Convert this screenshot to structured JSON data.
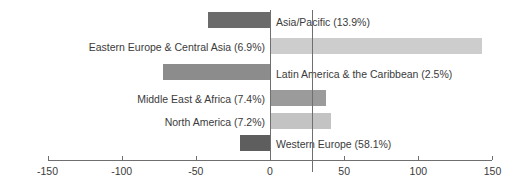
{
  "chart_data": {
    "type": "bar",
    "orientation": "horizontal",
    "title": "",
    "xlabel": "",
    "ylabel": "",
    "xlim": [
      -150,
      150
    ],
    "xticks": [
      -150,
      -100,
      -50,
      0,
      50,
      100,
      150
    ],
    "xtick_labels": [
      "-150",
      "-100",
      "-50",
      "0",
      "50",
      "100",
      "150"
    ],
    "grid": false,
    "legend": "none",
    "reference_line": 28,
    "categories": [
      "Asia/Pacific",
      "Eastern Europe & Central Asia",
      "Latin America & the Caribbean",
      "Middle East & Africa",
      "North America",
      "Western Europe"
    ],
    "values": [
      -42,
      143,
      -72,
      38,
      41,
      -20
    ],
    "bars": [
      {
        "label": "Asia/Pacific (13.9%)",
        "category": "Asia/Pacific",
        "share": "13.9%",
        "value": -42,
        "color": "#6b6b6b",
        "label_side": "right"
      },
      {
        "label": "Eastern Europe & Central Asia (6.9%)",
        "category": "Eastern Europe & Central Asia",
        "share": "6.9%",
        "value": 143,
        "color": "#cdcdcd",
        "label_side": "left"
      },
      {
        "label": "Latin America & the Caribbean (2.5%)",
        "category": "Latin America & the Caribbean",
        "share": "2.5%",
        "value": -72,
        "color": "#8c8c8c",
        "label_side": "right"
      },
      {
        "label": "Middle East & Africa (7.4%)",
        "category": "Middle East & Africa",
        "share": "7.4%",
        "value": 38,
        "color": "#9b9b9b",
        "label_side": "left"
      },
      {
        "label": "North America (7.2%)",
        "category": "North America",
        "share": "7.2%",
        "value": 41,
        "color": "#c3c3c3",
        "label_side": "left"
      },
      {
        "label": "Western Europe (58.1%)",
        "category": "Western Europe",
        "share": "58.1%",
        "value": -20,
        "color": "#5e5e5e",
        "label_side": "right"
      }
    ],
    "colors": {
      "axis": "#6f6f6f",
      "text": "#3b3b3b",
      "background": "#ffffff"
    }
  },
  "axis": {
    "tick_0": "-150",
    "tick_1": "-100",
    "tick_2": "-50",
    "tick_3": "0",
    "tick_4": "50",
    "tick_5": "100",
    "tick_6": "150"
  },
  "labels": {
    "bar_0": "Asia/Pacific (13.9%)",
    "bar_1": "Eastern Europe & Central Asia (6.9%)",
    "bar_2": "Latin America & the Caribbean (2.5%)",
    "bar_3": "Middle East & Africa (7.4%)",
    "bar_4": "North America (7.2%)",
    "bar_5": "Western Europe (58.1%)"
  }
}
